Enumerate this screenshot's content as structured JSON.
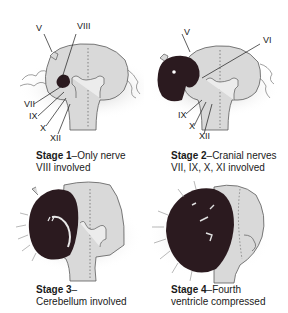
{
  "figure": {
    "panels": [
      {
        "id": "stage-1",
        "caption_bold": "Stage 1",
        "caption_rest": "–Only nerve",
        "caption_line2": "VIII involved",
        "nerve_labels": [
          "V",
          "VIII",
          "VII",
          "IX",
          "X",
          "XII"
        ]
      },
      {
        "id": "stage-2",
        "caption_bold": "Stage 2",
        "caption_rest": "–Cranial nerves",
        "caption_line2": "VII, IX, X, XI involved",
        "nerve_labels": [
          "V",
          "VI",
          "IX",
          "X",
          "XII"
        ]
      },
      {
        "id": "stage-3",
        "caption_bold": "Stage 3",
        "caption_rest": "–",
        "caption_line2": "Cerebellum involved",
        "nerve_labels": []
      },
      {
        "id": "stage-4",
        "caption_bold": "Stage 4",
        "caption_rest": "–Fourth",
        "caption_line2": "ventricle compressed",
        "nerve_labels": []
      }
    ],
    "colors": {
      "brainstem": "#d9d9d9",
      "outline": "#5a5a5a",
      "tumor": "#2b1a1f",
      "shadow": "#bdbdbd"
    }
  }
}
